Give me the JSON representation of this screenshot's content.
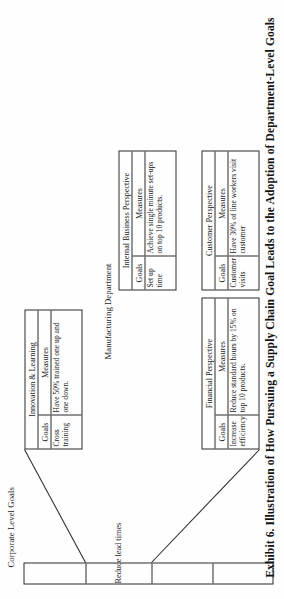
{
  "figure": {
    "caption": "Exhibit 6. Illustration of How Pursuing a Supply Chain Goal Leads to the Adoption of Department-Level Goals",
    "corporate": {
      "title": "Corporate Level Goals",
      "cells": [
        {
          "label": ""
        },
        {
          "label": "Reduce lead times"
        },
        {
          "label": ""
        },
        {
          "label": ""
        }
      ]
    },
    "department": {
      "title": "Manufacturing Department",
      "column_headers": {
        "goals": "Goals",
        "measures": "Measures"
      },
      "perspectives": [
        {
          "name": "Financial Perspective",
          "goal": "Increase efficiency",
          "measure": "Reduce standard hours by 15% on top 10 products."
        },
        {
          "name": "Customer Perspective",
          "goal": "Customer visits",
          "measure": "Have 30% of line workers visit customer"
        },
        {
          "name": "Internal Business Perspective",
          "goal": "Set up time",
          "measure": "Achieve single minute set-ups on top 10 products."
        },
        {
          "name": "Innovation & Learning",
          "goal": "Cross training",
          "measure": "Have 50% trained one up and one down."
        }
      ]
    },
    "colors": {
      "ink": "#2b2b2b",
      "paper": "#fefefe",
      "caption_ink": "#121212"
    }
  }
}
